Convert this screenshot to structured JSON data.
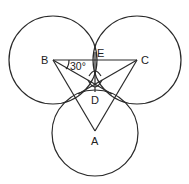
{
  "diagram": {
    "title": "",
    "stroke_color": "#2a2a2a",
    "background": "#ffffff",
    "points": [
      {
        "id": "B",
        "label": "B",
        "x": 53,
        "y": 60
      },
      {
        "id": "C",
        "label": "C",
        "x": 137,
        "y": 60
      },
      {
        "id": "A",
        "label": "A",
        "x": 95,
        "y": 131
      },
      {
        "id": "E",
        "label": "E",
        "x": 95,
        "y": 60
      },
      {
        "id": "D",
        "label": "D",
        "x": 95,
        "y": 87
      }
    ],
    "circles": [
      {
        "center": "B",
        "cx": 53,
        "cy": 60,
        "r": 44
      },
      {
        "center": "C",
        "cx": 137,
        "cy": 60,
        "r": 44
      },
      {
        "center": "A",
        "cx": 95,
        "cy": 133,
        "r": 43
      }
    ],
    "triangle": [
      "A",
      "B",
      "C"
    ],
    "segments": [
      [
        "B",
        "C"
      ],
      [
        "B",
        "A"
      ],
      [
        "C",
        "A"
      ],
      [
        "E",
        "D"
      ],
      [
        "B",
        "D"
      ],
      [
        "C",
        "D"
      ]
    ],
    "angle_annotation": {
      "vertex": "B",
      "label": "30°"
    },
    "labels": {
      "A": "A",
      "B": "B",
      "C": "C",
      "D": "D",
      "E": "E",
      "angle": "30°"
    }
  }
}
